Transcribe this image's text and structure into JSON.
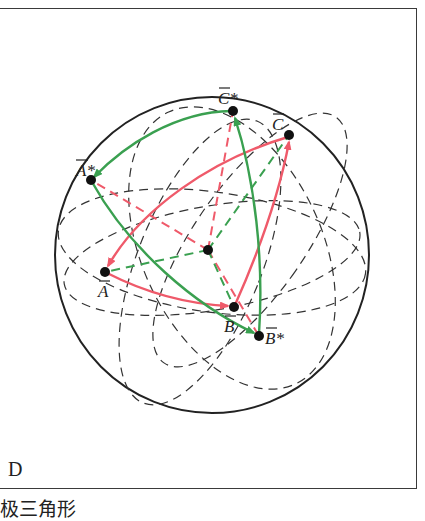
{
  "figure": {
    "panel_label": "D",
    "caption": "极三角形",
    "colors": {
      "red": "#ef5a6a",
      "green": "#3aa050",
      "outline": "#222222",
      "dashed": "#333333"
    },
    "points": [
      {
        "id": "A",
        "label": "A",
        "bar": true,
        "star": false
      },
      {
        "id": "B",
        "label": "B",
        "bar": true,
        "star": false
      },
      {
        "id": "C",
        "label": "C",
        "bar": true,
        "star": false
      },
      {
        "id": "A_star",
        "label": "A*",
        "bar": true,
        "star": true
      },
      {
        "id": "B_star",
        "label": "B*",
        "bar": true,
        "star": true
      },
      {
        "id": "C_star",
        "label": "C*",
        "bar": true,
        "star": true
      },
      {
        "id": "O",
        "label": "",
        "bar": false,
        "star": false
      }
    ],
    "labels": {
      "A": "A",
      "B": "B",
      "C": "C",
      "A_star": "A*",
      "B_star": "B*",
      "C_star": "C*"
    }
  }
}
